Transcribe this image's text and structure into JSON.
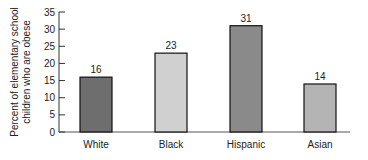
{
  "chart_data": {
    "type": "bar",
    "title": "",
    "xlabel": "",
    "ylabel": [
      "Percent of elementary school",
      "children who are obese"
    ],
    "categories": [
      "White",
      "Black",
      "Hispanic",
      "Asian"
    ],
    "values": [
      16,
      23,
      31,
      14
    ],
    "data_labels": [
      "16",
      "23",
      "31",
      "14"
    ],
    "bar_colors": [
      "#6e6e6e",
      "#d0d0d0",
      "#8a8a8a",
      "#b4b4b4"
    ],
    "ylim": [
      0,
      35
    ],
    "yticks": [
      0,
      5,
      10,
      15,
      20,
      25,
      30,
      35
    ],
    "grid": false,
    "legend": "none"
  }
}
